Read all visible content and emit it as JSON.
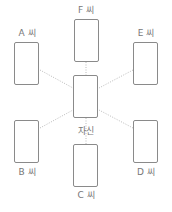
{
  "diagram": {
    "center": {
      "label": "자신"
    },
    "people": [
      {
        "id": "F",
        "label": "F 씨"
      },
      {
        "id": "A",
        "label": "A 씨"
      },
      {
        "id": "E",
        "label": "E 씨"
      },
      {
        "id": "B",
        "label": "B 씨"
      },
      {
        "id": "D",
        "label": "D 씨"
      },
      {
        "id": "C",
        "label": "C 씨"
      }
    ],
    "colors": {
      "border": "#8a8a8a",
      "line": "#bbbbbb",
      "text": "#777777"
    }
  }
}
